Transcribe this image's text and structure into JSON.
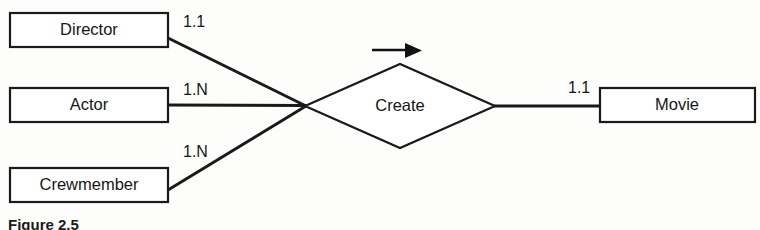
{
  "figure": {
    "caption": "Figure 2.5",
    "background_color": "#fdfdfc",
    "ink_color": "#1a1a1a"
  },
  "diagram": {
    "type": "entity-relationship",
    "entities": [
      {
        "id": "director",
        "label": "Director",
        "x": 10,
        "y": 13,
        "width": 158,
        "height": 34
      },
      {
        "id": "actor",
        "label": "Actor",
        "x": 10,
        "y": 88,
        "width": 158,
        "height": 34
      },
      {
        "id": "crewmember",
        "label": "Crewmember",
        "x": 10,
        "y": 168,
        "width": 158,
        "height": 34
      },
      {
        "id": "movie",
        "label": "Movie",
        "x": 600,
        "y": 88,
        "width": 155,
        "height": 34
      }
    ],
    "relationship": {
      "id": "create",
      "label": "Create",
      "center_x": 400,
      "center_y": 106,
      "half_width": 95,
      "half_height": 42
    },
    "junction": {
      "x": 305,
      "y": 106
    },
    "connections": [
      {
        "from": "director",
        "to": "create",
        "cardinality": "1.1",
        "label_x": 183,
        "label_y": 23
      },
      {
        "from": "actor",
        "to": "create",
        "cardinality": "1.N",
        "label_x": 183,
        "label_y": 91
      },
      {
        "from": "crewmember",
        "to": "create",
        "cardinality": "1.N",
        "label_x": 183,
        "label_y": 153
      },
      {
        "from": "create",
        "to": "movie",
        "cardinality": "1.1",
        "label_x": 568,
        "label_y": 89
      }
    ],
    "direction_arrow": {
      "name": "direction-arrow",
      "x_start": 372,
      "x_end": 420,
      "y": 50
    }
  }
}
